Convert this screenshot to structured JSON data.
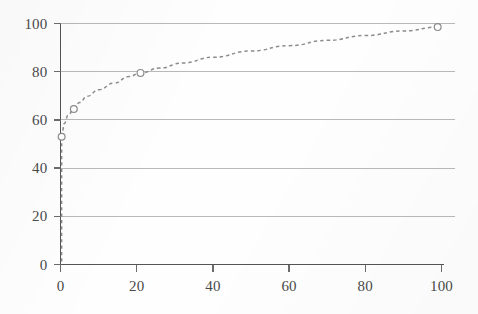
{
  "chart_data": {
    "type": "line",
    "title": "",
    "subtitle": "",
    "xlabel": "",
    "ylabel": "",
    "xlim": [
      0,
      100
    ],
    "ylim": [
      0,
      100
    ],
    "grid": true,
    "grid_axis": "y",
    "legend": false,
    "legend_position": "none",
    "line_style": "dashed",
    "marker": "open-circle",
    "series_color": "#8c8c8c",
    "x_ticks": [
      0,
      20,
      40,
      60,
      80,
      100
    ],
    "y_ticks": [
      0,
      20,
      40,
      60,
      80,
      100
    ],
    "x_tick_labels": [
      "0",
      "20",
      "40",
      "60",
      "80",
      "100"
    ],
    "y_tick_labels": [
      "0",
      "20",
      "40",
      "60",
      "80",
      "100"
    ],
    "series": [
      {
        "name": "curve",
        "marker_points": [
          {
            "x": 0.3,
            "y": 53.0
          },
          {
            "x": 3.5,
            "y": 64.5
          },
          {
            "x": 21.0,
            "y": 79.5
          },
          {
            "x": 99.0,
            "y": 98.5
          }
        ],
        "x": [
          0.3,
          1,
          2,
          3.5,
          5,
          7,
          10,
          14,
          18,
          21,
          26,
          32,
          40,
          50,
          60,
          70,
          80,
          90,
          99
        ],
        "y": [
          53.0,
          58.5,
          62.0,
          64.5,
          67.2,
          69.8,
          72.5,
          75.2,
          78.0,
          79.5,
          81.5,
          83.6,
          86.0,
          88.6,
          90.8,
          93.0,
          95.0,
          96.9,
          98.5
        ]
      }
    ],
    "drop_line": {
      "x": 0.3,
      "y_from": 53.0,
      "y_to": 0,
      "style": "dashed"
    }
  },
  "axes": {
    "y_axis_color": "#555555",
    "x_axis_color": "#555555",
    "gridline_color": "#b9b9b9",
    "tick_color": "#6b6b6b",
    "label_color": "#4a4a4a"
  },
  "background": {
    "color": "#fefefe"
  }
}
